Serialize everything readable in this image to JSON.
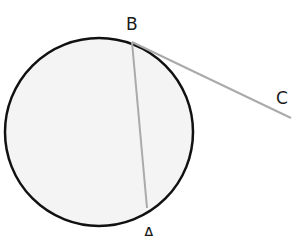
{
  "diagram": {
    "type": "geometry",
    "circle": {
      "cx": 99,
      "cy": 132,
      "r": 94,
      "fill": "#f4f4f4",
      "stroke": "#111111",
      "stroke_width": 2.5
    },
    "points": [
      {
        "id": "B",
        "label": "B",
        "x": 132,
        "y": 42,
        "label_x": 126,
        "label_y": 30
      },
      {
        "id": "A",
        "label": "A",
        "x": 147,
        "y": 208,
        "label_x": 143,
        "label_y": 236
      },
      {
        "id": "C",
        "label": "C",
        "x": 291,
        "y": 118,
        "label_x": 276,
        "label_y": 104
      }
    ],
    "segments": [
      {
        "name": "chord-BA",
        "from": "B",
        "to": "A",
        "stroke": "#aaaaaa"
      },
      {
        "name": "tangent-BC",
        "from": "B",
        "to": "C",
        "stroke": "#aaaaaa"
      }
    ]
  }
}
